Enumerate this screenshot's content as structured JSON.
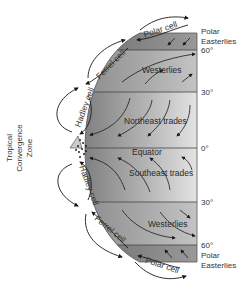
{
  "diagram": {
    "type": "atmospheric-circulation",
    "cells": {
      "north": [
        "Polar cell",
        "Ferrel cell",
        "Hadley cell"
      ],
      "south": [
        "Hadley cell",
        "Ferrel cell",
        "Polar cell"
      ]
    },
    "wind_belts": {
      "north_polar": "Polar Easterlies",
      "north_westerlies": "Westerlies",
      "north_trades": "Northeast trades",
      "equator": "Equator",
      "south_trades": "Southeast trades",
      "south_westerlies": "Westerlies",
      "south_polar": "Polar Easterlies"
    },
    "latitudes": {
      "n60": "60°",
      "n30": "30°",
      "eq": "0°",
      "s30": "30°",
      "s60": "60°"
    },
    "side_labels": {
      "polar_n_line1": "Polar",
      "polar_n_line2": "Easterlies",
      "polar_s_line1": "Polar",
      "polar_s_line2": "Easterlies"
    },
    "itcz": {
      "line1": "Tropical",
      "line2": "Convergence",
      "line3": "Zone"
    },
    "colors": {
      "globe_dark": "#8a8a8a",
      "globe_light": "#e4e4e4",
      "band_line": "#444444",
      "arrow": "#1a1a1a"
    }
  }
}
